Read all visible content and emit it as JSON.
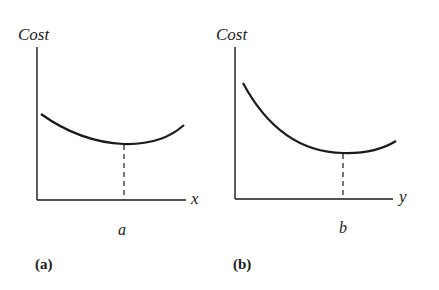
{
  "panels": [
    {
      "id": "a",
      "caption": "(a)",
      "y_axis_label": "Cost",
      "x_axis_label": "x",
      "minimum_label": "a",
      "curve": "shallow U-shaped cost curve with minimum at a"
    },
    {
      "id": "b",
      "caption": "(b)",
      "y_axis_label": "Cost",
      "x_axis_label": "y",
      "minimum_label": "b",
      "curve": "steeply declining convex cost curve with minimum at b"
    }
  ],
  "colors": {
    "line": "#1a1a1a",
    "background": "#ffffff"
  }
}
